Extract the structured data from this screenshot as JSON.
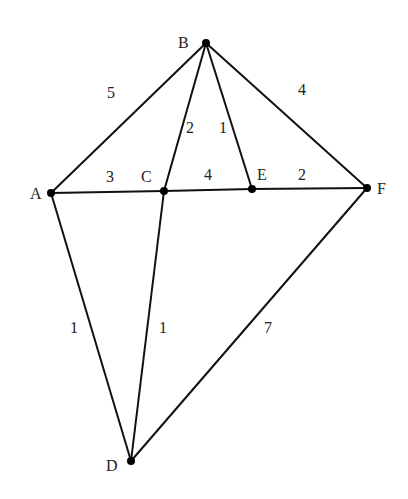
{
  "nodes": [
    {
      "id": "A",
      "label": "A",
      "x": 51,
      "y": 193,
      "lx": 30,
      "ly": 199
    },
    {
      "id": "B",
      "label": "B",
      "x": 206,
      "y": 43,
      "lx": 178,
      "ly": 48
    },
    {
      "id": "C",
      "label": "C",
      "x": 164,
      "y": 191,
      "lx": 141,
      "ly": 182
    },
    {
      "id": "D",
      "label": "D",
      "x": 131,
      "y": 461,
      "lx": 106,
      "ly": 471
    },
    {
      "id": "E",
      "label": "E",
      "x": 252,
      "y": 189,
      "lx": 257,
      "ly": 180
    },
    {
      "id": "F",
      "label": "F",
      "x": 367,
      "y": 188,
      "lx": 377,
      "ly": 194
    }
  ],
  "edges": [
    {
      "from": "A",
      "to": "B",
      "weight": "5",
      "lx": 107,
      "ly": 98
    },
    {
      "from": "B",
      "to": "C",
      "weight": "2",
      "lx": 186,
      "ly": 133
    },
    {
      "from": "B",
      "to": "E",
      "weight": "1",
      "lx": 219,
      "ly": 133
    },
    {
      "from": "B",
      "to": "F",
      "weight": "4",
      "lx": 298,
      "ly": 95
    },
    {
      "from": "A",
      "to": "C",
      "weight": "3",
      "lx": 106,
      "ly": 182
    },
    {
      "from": "C",
      "to": "E",
      "weight": "4",
      "lx": 204,
      "ly": 180
    },
    {
      "from": "E",
      "to": "F",
      "weight": "2",
      "lx": 298,
      "ly": 180
    },
    {
      "from": "A",
      "to": "D",
      "weight": "1",
      "lx": 70,
      "ly": 333
    },
    {
      "from": "C",
      "to": "D",
      "weight": "1",
      "lx": 159,
      "ly": 333
    },
    {
      "from": "F",
      "to": "D",
      "weight": "7",
      "lx": 264,
      "ly": 333
    }
  ]
}
